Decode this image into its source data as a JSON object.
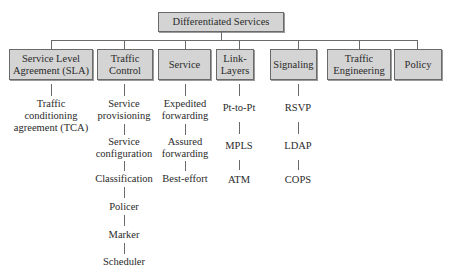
{
  "diagram": {
    "root": {
      "label": "Differentiated Services"
    },
    "categories": [
      {
        "label": "Service Level Agreement (SLA)",
        "label_lines": [
          "Service Level",
          "Agreement (SLA)"
        ],
        "children": [
          {
            "label": "Traffic conditioning agreement (TCA)",
            "lines": [
              "Traffic",
              "conditioning",
              "agreement (TCA)"
            ]
          }
        ]
      },
      {
        "label": "Traffic Control",
        "label_lines": [
          "Traffic",
          "Control"
        ],
        "children": [
          {
            "label": "Service provisioning",
            "lines": [
              "Service",
              "provisioning"
            ]
          },
          {
            "label": "Service configuration",
            "lines": [
              "Service",
              "configuration"
            ]
          },
          {
            "label": "Classification",
            "lines": [
              "Classification"
            ]
          },
          {
            "label": "Policer",
            "lines": [
              "Policer"
            ]
          },
          {
            "label": "Marker",
            "lines": [
              "Marker"
            ]
          },
          {
            "label": "Scheduler",
            "lines": [
              "Scheduler"
            ]
          }
        ]
      },
      {
        "label": "Service",
        "label_lines": [
          "Service"
        ],
        "children": [
          {
            "label": "Expedited forwarding",
            "lines": [
              "Expedited",
              "forwarding"
            ]
          },
          {
            "label": "Assured forwarding",
            "lines": [
              "Assured",
              "forwarding"
            ]
          },
          {
            "label": "Best-effort",
            "lines": [
              "Best-effort"
            ]
          }
        ]
      },
      {
        "label": "Link-Layers",
        "label_lines": [
          "Link-",
          "Layers"
        ],
        "children": [
          {
            "label": "Pt-to-Pt",
            "lines": [
              "Pt-to-Pt"
            ]
          },
          {
            "label": "MPLS",
            "lines": [
              "MPLS"
            ]
          },
          {
            "label": "ATM",
            "lines": [
              "ATM"
            ]
          }
        ]
      },
      {
        "label": "Signaling",
        "label_lines": [
          "Signaling"
        ],
        "children": [
          {
            "label": "RSVP",
            "lines": [
              "RSVP"
            ]
          },
          {
            "label": "LDAP",
            "lines": [
              "LDAP"
            ]
          },
          {
            "label": "COPS",
            "lines": [
              "COPS"
            ]
          }
        ]
      },
      {
        "label": "Traffic Engineering",
        "label_lines": [
          "Traffic",
          "Engineering"
        ],
        "children": []
      },
      {
        "label": "Policy",
        "label_lines": [
          "Policy"
        ],
        "children": []
      }
    ]
  },
  "colors": {
    "box_fill": "#d4d4d4",
    "box_border": "#6a6a6a",
    "line": "#6a6a6a",
    "text": "#2a2a2a",
    "background": "#ffffff"
  }
}
